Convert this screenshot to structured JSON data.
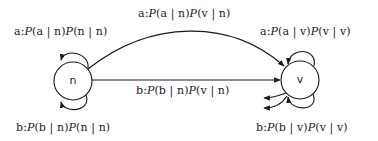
{
  "diagram": {
    "type": "state-transition",
    "nodes": [
      {
        "id": "n",
        "label": "n",
        "cx": 73,
        "cy": 81,
        "r": 19
      },
      {
        "id": "v",
        "label": "v",
        "cx": 300,
        "cy": 80,
        "r": 19
      }
    ],
    "edges": [
      {
        "id": "n-to-n-a",
        "from": "n",
        "to": "n",
        "kind": "self-loop-top",
        "label": "a:P(a | n)P(n | n)"
      },
      {
        "id": "n-to-n-b",
        "from": "n",
        "to": "n",
        "kind": "self-loop-bottom",
        "label": "b:P(b | n)P(n | n)"
      },
      {
        "id": "n-to-v-a",
        "from": "n",
        "to": "v",
        "kind": "curved-arc",
        "label": "a:P(a | n)P(v | n)"
      },
      {
        "id": "n-to-v-b",
        "from": "n",
        "to": "v",
        "kind": "straight",
        "label": "b:P(b | n)P(v | n)"
      },
      {
        "id": "v-to-v-a",
        "from": "v",
        "to": "v",
        "kind": "self-loop-top",
        "label": "a:P(a | v)P(v | v)"
      },
      {
        "id": "v-to-v-b",
        "from": "v",
        "to": "v",
        "kind": "self-loop-bottom",
        "label": "b:P(b | v)P(v | v)"
      }
    ],
    "outgoing_stubs_from_v": 2,
    "colors": {
      "stroke": "#1a1a1a",
      "background": "#ffffff"
    }
  },
  "labels": {
    "node_n": "n",
    "node_v": "v",
    "nn_a": {
      "prefix": "a:",
      "p1": "P",
      "a1": "(a | n)",
      "p2": "P",
      "a2": "(n | n)"
    },
    "nn_b": {
      "prefix": "b:",
      "p1": "P",
      "a1": "(b | n)",
      "p2": "P",
      "a2": "(n | n)"
    },
    "nv_a": {
      "prefix": "a:",
      "p1": "P",
      "a1": "(a | n)",
      "p2": "P",
      "a2": "(v | n)"
    },
    "nv_b": {
      "prefix": "b:",
      "p1": "P",
      "a1": "(b | n)",
      "p2": "P",
      "a2": "(v | n)"
    },
    "vv_a": {
      "prefix": "a:",
      "p1": "P",
      "a1": "(a | v)",
      "p2": "P",
      "a2": "(v | v)"
    },
    "vv_b": {
      "prefix": "b:",
      "p1": "P",
      "a1": "(b | v)",
      "p2": "P",
      "a2": "(v | v)"
    }
  }
}
